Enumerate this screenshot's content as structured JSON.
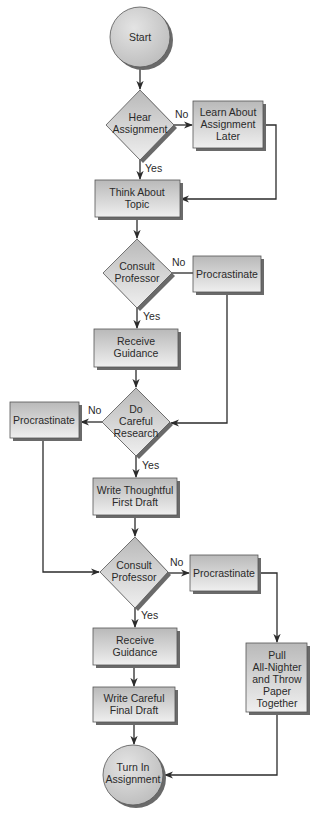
{
  "colors": {
    "fill_top": "#b9b9b9",
    "fill_bottom": "#efefef",
    "shadow": "#6a6a6a",
    "line": "#2b2b2b",
    "text": "#2a2a2a"
  },
  "nodes": {
    "start": {
      "type": "terminal",
      "lines": [
        "Start"
      ]
    },
    "hear": {
      "type": "decision",
      "lines": [
        "Hear",
        "Assignment"
      ]
    },
    "learn_later": {
      "type": "process",
      "lines": [
        "Learn About",
        "Assignment",
        "Later"
      ]
    },
    "think": {
      "type": "process",
      "lines": [
        "Think About",
        "Topic"
      ]
    },
    "consult1": {
      "type": "decision",
      "lines": [
        "Consult",
        "Professor"
      ]
    },
    "procrastinate1": {
      "type": "process",
      "lines": [
        "Procrastinate"
      ]
    },
    "receive1": {
      "type": "process",
      "lines": [
        "Receive",
        "Guidance"
      ]
    },
    "research": {
      "type": "decision",
      "lines": [
        "Do",
        "Careful",
        "Research"
      ]
    },
    "procrastinate2": {
      "type": "process",
      "lines": [
        "Procrastinate"
      ]
    },
    "write_first": {
      "type": "process",
      "lines": [
        "Write Thoughtful",
        "First Draft"
      ]
    },
    "consult2": {
      "type": "decision",
      "lines": [
        "Consult",
        "Professor"
      ]
    },
    "procrastinate3": {
      "type": "process",
      "lines": [
        "Procrastinate"
      ]
    },
    "pull": {
      "type": "process",
      "lines": [
        "Pull",
        "All-Nighter",
        "and Throw",
        "Paper",
        "Together"
      ]
    },
    "receive2": {
      "type": "process",
      "lines": [
        "Receive",
        "Guidance"
      ]
    },
    "write_final": {
      "type": "process",
      "lines": [
        "Write Careful",
        "Final Draft"
      ]
    },
    "turn_in": {
      "type": "terminal",
      "lines": [
        "Turn In",
        "Assignment"
      ]
    }
  },
  "edges": [
    {
      "from": "start",
      "to": "hear",
      "label": ""
    },
    {
      "from": "hear",
      "to": "learn_later",
      "label": "No"
    },
    {
      "from": "hear",
      "to": "think",
      "label": "Yes"
    },
    {
      "from": "learn_later",
      "to": "think",
      "label": ""
    },
    {
      "from": "think",
      "to": "consult1",
      "label": ""
    },
    {
      "from": "consult1",
      "to": "procrastinate1",
      "label": "No"
    },
    {
      "from": "consult1",
      "to": "receive1",
      "label": "Yes"
    },
    {
      "from": "procrastinate1",
      "to": "research",
      "label": ""
    },
    {
      "from": "receive1",
      "to": "research",
      "label": ""
    },
    {
      "from": "research",
      "to": "procrastinate2",
      "label": "No"
    },
    {
      "from": "research",
      "to": "write_first",
      "label": "Yes"
    },
    {
      "from": "procrastinate2",
      "to": "consult2",
      "label": ""
    },
    {
      "from": "write_first",
      "to": "consult2",
      "label": ""
    },
    {
      "from": "consult2",
      "to": "procrastinate3",
      "label": "No"
    },
    {
      "from": "consult2",
      "to": "receive2",
      "label": "Yes"
    },
    {
      "from": "procrastinate3",
      "to": "pull",
      "label": ""
    },
    {
      "from": "receive2",
      "to": "write_final",
      "label": ""
    },
    {
      "from": "write_final",
      "to": "turn_in",
      "label": ""
    },
    {
      "from": "pull",
      "to": "turn_in",
      "label": ""
    }
  ]
}
